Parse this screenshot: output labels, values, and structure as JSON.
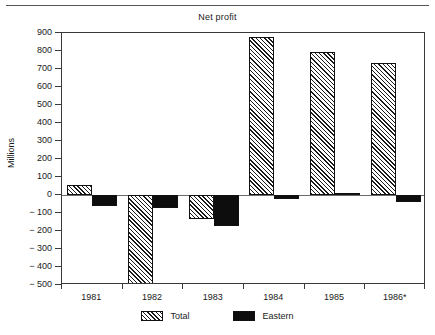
{
  "chart_data": {
    "type": "bar",
    "title": "Net profit",
    "xlabel": "",
    "ylabel": "Millions",
    "categories": [
      "1981",
      "1982",
      "1983",
      "1984",
      "1985",
      "1986*"
    ],
    "series": [
      {
        "name": "Total",
        "values": [
          55,
          -650,
          -135,
          880,
          795,
          735
        ]
      },
      {
        "name": "Eastern",
        "values": [
          -60,
          -70,
          -170,
          -20,
          10,
          -40
        ]
      }
    ],
    "ylim": [
      -500,
      900
    ],
    "yticks": [
      900,
      800,
      700,
      600,
      500,
      400,
      300,
      200,
      100,
      0,
      -100,
      -200,
      -300,
      -400,
      -500
    ],
    "ytick_labels": [
      "900",
      "800",
      "700",
      "600",
      "500",
      "400",
      "300",
      "200",
      "100",
      "0",
      "− 100",
      "− 200",
      "− 300",
      "− 400",
      "− 500"
    ],
    "grid": false,
    "legend_position": "bottom",
    "colors": {
      "total_fill": "#ffffff",
      "total_hatch": "#1a1a1a",
      "eastern_fill": "#0d0d0d",
      "axis": "#3a3a3a",
      "background": "#ffffff"
    }
  },
  "legend": {
    "entries": [
      {
        "label": "Total"
      },
      {
        "label": "Eastern"
      }
    ]
  }
}
